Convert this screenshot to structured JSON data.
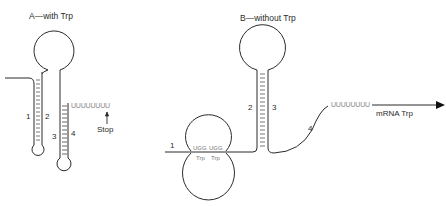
{
  "panel_a": {
    "title": "A—with Trp",
    "stem_labels": [
      "1",
      "2",
      "3",
      "4"
    ],
    "u_tract": "UUUUUUUU",
    "stop_label": "Stop",
    "icons": [
      "up-arrow-icon"
    ]
  },
  "panel_b": {
    "title": "B—without Trp",
    "stem_labels": [
      "1",
      "2",
      "3",
      "4"
    ],
    "codon_1": "UGG",
    "codon_2": "UGG",
    "aa_1": "Trp",
    "aa_2": "Trp",
    "u_tract": "UUUUUUUU",
    "mrna_label": "mRNA Trp",
    "icons": [
      "right-arrow-icon"
    ]
  },
  "colors": {
    "line": "#2a2a2a",
    "pair_ticks": "#555555",
    "faint_text": "#888888",
    "background": "#ffffff"
  }
}
